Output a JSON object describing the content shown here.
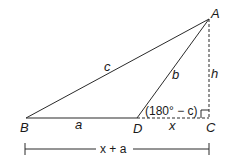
{
  "diagram": {
    "type": "triangle-geometry",
    "colors": {
      "stroke": "#2a2a2a",
      "background": "#ffffff"
    },
    "points": {
      "A": {
        "label": "A",
        "x": 209,
        "y": 19
      },
      "B": {
        "label": "B",
        "x": 26,
        "y": 118
      },
      "C": {
        "label": "C",
        "x": 209,
        "y": 118
      },
      "D": {
        "label": "D",
        "x": 137,
        "y": 118
      }
    },
    "sides": {
      "c": "c",
      "b": "b",
      "a": "a",
      "x": "x",
      "h": "h"
    },
    "angle_label": "(180° − c)",
    "dimension_label": "x + a",
    "right_angle_marker": true
  }
}
